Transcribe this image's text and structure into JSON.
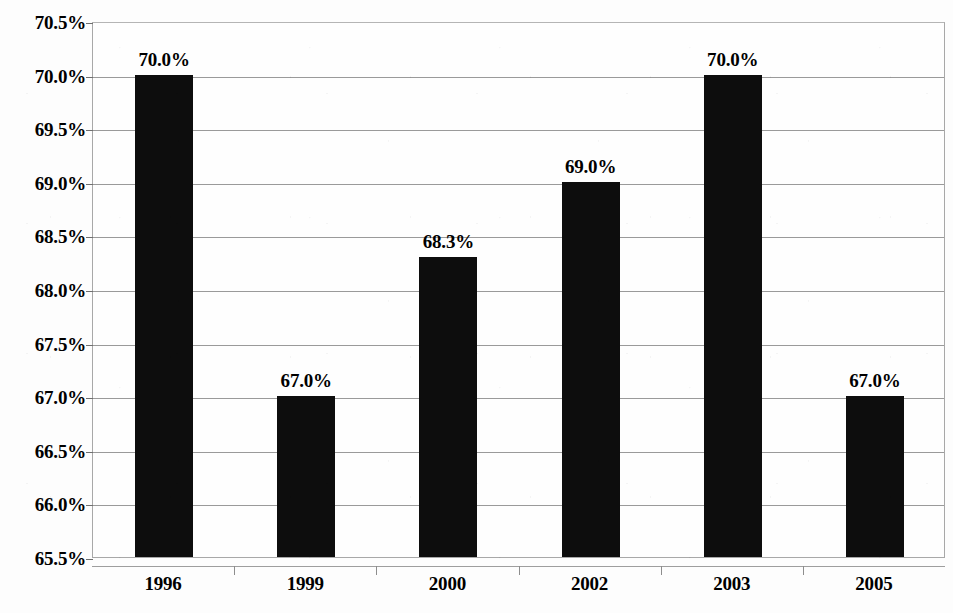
{
  "chart_data": {
    "type": "bar",
    "title": "",
    "subtitle": "",
    "xlabel": "",
    "ylabel": "",
    "categories": [
      "1996",
      "1999",
      "2000",
      "2002",
      "2003",
      "2005"
    ],
    "values": [
      70.0,
      67.0,
      68.3,
      69.0,
      70.0,
      67.0
    ],
    "data_labels": [
      "70.0%",
      "67.0%",
      "68.3%",
      "69.0%",
      "70.0%",
      "67.0%"
    ],
    "ylim": [
      65.5,
      70.5
    ],
    "ytick_values": [
      70.5,
      70.0,
      69.5,
      69.0,
      68.5,
      68.0,
      67.5,
      67.0,
      66.5,
      66.0,
      65.5
    ],
    "ytick_labels": [
      "70.5%",
      "70.0%",
      "69.5%",
      "69.0%",
      "68.5%",
      "68.0%",
      "67.5%",
      "67.0%",
      "66.5%",
      "66.0%",
      "65.5%"
    ],
    "grid": true,
    "legend": false,
    "legend_position": "none",
    "series": [
      {
        "name": "",
        "values": [
          70.0,
          67.0,
          68.3,
          69.0,
          70.0,
          67.0
        ]
      }
    ],
    "bar_color": "#0d0d0d",
    "gridline_color": "#9a9a9a",
    "axis_color": "#a8a8a8",
    "text_color": "#000000",
    "background_color": "#ffffff"
  }
}
